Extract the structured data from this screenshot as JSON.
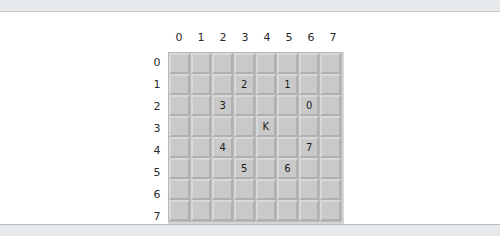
{
  "board": {
    "name": "minesweeper-grid",
    "rows": 8,
    "cols": 8,
    "column_headers": [
      "0",
      "1",
      "2",
      "3",
      "4",
      "5",
      "6",
      "7"
    ],
    "row_headers": [
      "0",
      "1",
      "2",
      "3",
      "4",
      "5",
      "6",
      "7"
    ],
    "cells": [
      [
        "",
        "",
        "",
        "",
        "",
        "",
        "",
        ""
      ],
      [
        "",
        "",
        "",
        "2",
        "",
        "1",
        "",
        ""
      ],
      [
        "",
        "",
        "3",
        "",
        "",
        "",
        "0",
        ""
      ],
      [
        "",
        "",
        "",
        "",
        "K",
        "",
        "",
        ""
      ],
      [
        "",
        "",
        "4",
        "",
        "",
        "",
        "7",
        ""
      ],
      [
        "",
        "",
        "",
        "5",
        "",
        "6",
        "",
        ""
      ],
      [
        "",
        "",
        "",
        "",
        "",
        "",
        "",
        ""
      ],
      [
        "",
        "",
        "",
        "",
        "",
        "",
        "",
        ""
      ]
    ]
  },
  "colors": {
    "page_background": "#e7eaec",
    "card_background": "#ffffff",
    "grid_background": "#b9b9b9",
    "cell_face": "#c9c9c9",
    "cell_highlight": "#d8d8d8",
    "cell_shadow": "#b0b0b0",
    "text": "#1c1c1c"
  }
}
